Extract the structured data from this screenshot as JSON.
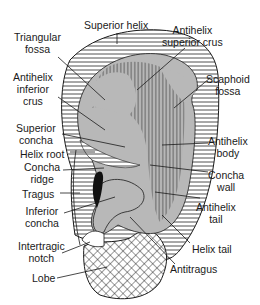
{
  "figure": {
    "colors": {
      "outline": "#1a1a1a",
      "gray_fill": "#b8b8b8",
      "hatch_line": "#222222",
      "tragus_fill": "#111111",
      "background": "#ffffff"
    }
  },
  "labels": {
    "superior_helix": [
      "Superior helix"
    ],
    "triangular_fossa": [
      "Triangular",
      "fossa"
    ],
    "antihelix_superior_crus": [
      "Antihelix",
      "superior crus"
    ],
    "antihelix_inferior_crus": [
      "Antihelix",
      "inferior",
      "crus"
    ],
    "scaphoid_fossa": [
      "Scaphoid",
      "fossa"
    ],
    "superior_concha": [
      "Superior",
      "concha"
    ],
    "helix_root": [
      "Helix root"
    ],
    "concha_ridge": [
      "Concha",
      "ridge"
    ],
    "antihelix_body": [
      "Antihelix",
      "body"
    ],
    "concha_wall": [
      "Concha",
      "wall"
    ],
    "tragus": [
      "Tragus"
    ],
    "inferior_concha": [
      "Inferior",
      "concha"
    ],
    "antihelix_tail": [
      "Antihelix",
      "tail"
    ],
    "intertragic_notch": [
      "Intertragic",
      "notch"
    ],
    "helix_tail": [
      "Helix tail"
    ],
    "antitragus": [
      "Antitragus"
    ],
    "lobe": [
      "Lobe"
    ]
  }
}
